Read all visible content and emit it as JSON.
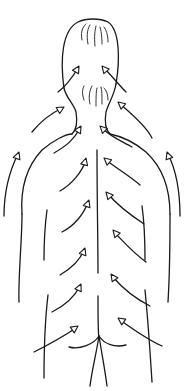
{
  "figure": {
    "stroke_color": "#1a1a1a",
    "background": "#ffffff",
    "outline": [
      "M64 88 C60 60 62 30 78 22 C86 18 100 18 108 22 C120 30 120 60 116 84",
      "M64 88 C66 98 74 104 76 112 C78 124 76 130 72 134",
      "M116 84 C114 96 108 104 106 112 C104 124 106 130 110 134",
      "M22 214 C20 185 28 165 42 150 C54 140 66 134 72 134",
      "M170 214 C170 185 160 165 146 152 C134 142 120 136 110 134",
      "M19 302 C18 280 22 240 22 214",
      "M168 302 C170 270 170 240 170 214",
      "M97 150 C97 200 98 240 98 273",
      "M98 296 C98 320 98 335 99 338",
      "M69 347 C80 350 94 344 99 336 C104 344 115 348 126 345",
      "M99 336 C96 355 92 370 90 386",
      "M99 336 C102 355 105 370 107 386",
      "M44 378 C44 350 45 320 48 295",
      "M152 382 C150 350 148 320 145 290",
      "M47 210 C45 225 44 240 44 260",
      "M142 206 C144 220 145 240 145 260"
    ],
    "hair": [
      "M82 40 C80 30 84 26 86 24",
      "M88 44 C86 34 88 28 90 25",
      "M95 46 C94 36 95 30 96 26",
      "M102 44 C102 36 101 30 100 27",
      "M108 42 C108 34 106 30 104 27",
      "M84 100 C82 94 82 90 84 86",
      "M90 104 C88 96 90 90 92 86",
      "M96 106 C96 98 96 92 97 88",
      "M102 104 C102 96 102 90 101 87",
      "M108 100 C108 94 106 90 104 88"
    ],
    "arrows": [
      {
        "path": "M58 92 C66 86 72 78 78 68",
        "tip": [
          79,
          66
        ],
        "angle": -60
      },
      {
        "path": "M126 92 C118 84 112 76 104 68",
        "tip": [
          102,
          66
        ],
        "angle": -130
      },
      {
        "path": "M32 132 C40 122 50 114 62 108",
        "tip": [
          64,
          107
        ],
        "angle": -30
      },
      {
        "path": "M152 138 C146 126 132 114 120 104",
        "tip": [
          118,
          102
        ],
        "angle": -140
      },
      {
        "path": "M4 216 C4 190 10 170 18 154",
        "tip": [
          19,
          152
        ],
        "angle": -70
      },
      {
        "path": "M180 216 C180 190 176 170 168 154",
        "tip": [
          167,
          152
        ],
        "angle": -110
      },
      {
        "path": "M54 153 C66 146 74 140 80 128",
        "tip": [
          81,
          126
        ],
        "angle": -60
      },
      {
        "path": "M132 147 C124 142 112 138 102 128",
        "tip": [
          100,
          126
        ],
        "angle": -135
      },
      {
        "path": "M60 191 C72 184 82 172 86 160",
        "tip": [
          86,
          158
        ],
        "angle": -75
      },
      {
        "path": "M140 185 C130 176 116 168 106 160",
        "tip": [
          104,
          158
        ],
        "angle": -140
      },
      {
        "path": "M62 232 C74 226 84 214 88 202",
        "tip": [
          89,
          200
        ],
        "angle": -70
      },
      {
        "path": "M144 224 C132 216 118 206 108 194",
        "tip": [
          106,
          192
        ],
        "angle": -130
      },
      {
        "path": "M60 275 C72 268 80 260 84 250",
        "tip": [
          85,
          248
        ],
        "angle": -70
      },
      {
        "path": "M146 262 C132 252 122 240 114 232",
        "tip": [
          113,
          230
        ],
        "angle": -130
      },
      {
        "path": "M52 312 C64 306 74 298 80 286",
        "tip": [
          81,
          284
        ],
        "angle": -65
      },
      {
        "path": "M150 306 C138 300 124 290 112 276",
        "tip": [
          111,
          274
        ],
        "angle": -125
      },
      {
        "path": "M34 352 C50 344 64 336 76 328",
        "tip": [
          78,
          326
        ],
        "angle": -35
      },
      {
        "path": "M162 346 C148 340 134 330 120 320",
        "tip": [
          118,
          318
        ],
        "angle": -145
      }
    ]
  }
}
